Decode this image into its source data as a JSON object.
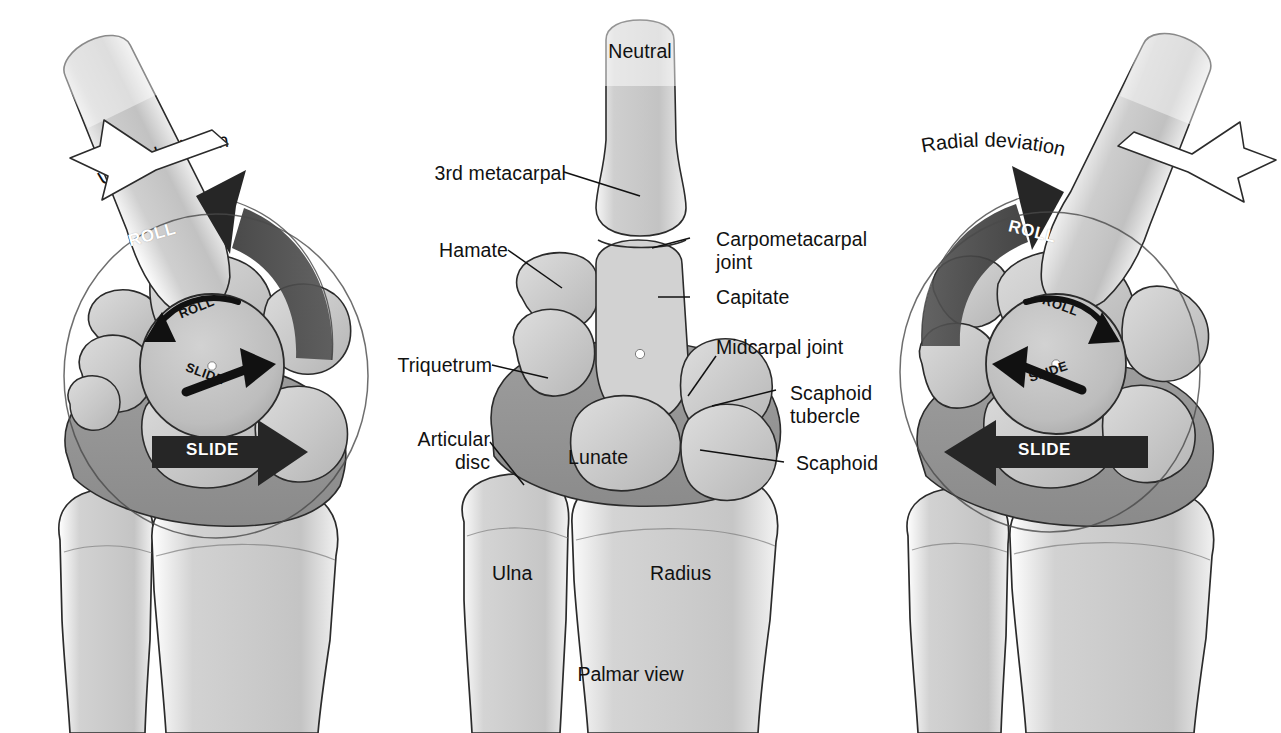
{
  "figure": {
    "caption": "Palmar view",
    "background_color": "#ffffff",
    "bone_fill": "#c9c9c9",
    "bone_fill_light": "#d6d6d6",
    "disc_fill": "#9a9a9a",
    "outline_color": "#2b2b2b",
    "arrow_dark_fill": "#262626",
    "arrow_band_fill": "#4a4a4a",
    "text_color": "#111111"
  },
  "panels": [
    {
      "id": "ulnar-deviation",
      "position": "left",
      "heading": "Ulnar deviation",
      "motion_labels": {
        "roll_major": "ROLL",
        "roll_minor": "ROLL",
        "slide_minor": "SLIDE",
        "slide_major": "SLIDE"
      },
      "roll_direction": "left",
      "slide_direction": "right"
    },
    {
      "id": "neutral",
      "position": "center",
      "heading": "Neutral",
      "motion_labels": {}
    },
    {
      "id": "radial-deviation",
      "position": "right",
      "heading": "Radial deviation",
      "motion_labels": {
        "roll_major": "ROLL",
        "roll_minor": "ROLL",
        "slide_minor": "SLIDE",
        "slide_major": "SLIDE"
      },
      "roll_direction": "right",
      "slide_direction": "left"
    }
  ],
  "labels": {
    "metacarpal": "3rd metacarpal",
    "hamate": "Hamate",
    "triquetrum": "Triquetrum",
    "articular_disc_line1": "Articular",
    "articular_disc_line2": "disc",
    "carpometacarpal_line1": "Carpometacarpal",
    "carpometacarpal_line2": "joint",
    "capitate": "Capitate",
    "midcarpal_joint": "Midcarpal joint",
    "scaphoid_tubercle_line1": "Scaphoid",
    "scaphoid_tubercle_line2": "tubercle",
    "scaphoid": "Scaphoid",
    "lunate": "Lunate",
    "ulna": "Ulna",
    "radius": "Radius"
  }
}
